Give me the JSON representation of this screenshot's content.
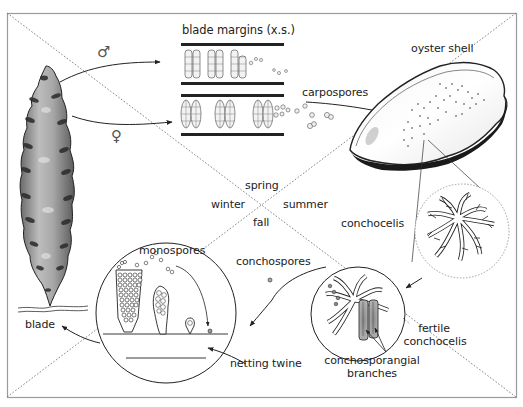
{
  "diagram": {
    "type": "life-cycle"
  },
  "labels": {
    "blade_margins": "blade margins (x.s.)",
    "male_symbol": "♂",
    "female_symbol": "♀",
    "carpospores": "carpospores",
    "oyster_shell": "oyster shell",
    "conchocelis": "conchocelis",
    "spring": "spring",
    "winter": "winter",
    "summer": "summer",
    "fall": "fall",
    "monospores": "monospores",
    "conchospores": "conchospores",
    "fertile_line1": "fertile",
    "fertile_line2": "conchocelis",
    "conchosporangial_line1": "conchosporangial",
    "conchosporangial_line2": "branches",
    "blade": "blade",
    "netting_twine": "netting twine"
  },
  "colors": {
    "ink": "#222222",
    "frame": "#9a9a9a",
    "dotted": "#777777",
    "shade_light": "#d8d8d8",
    "shade_mid": "#9a9a9a",
    "shade_dark": "#333333"
  }
}
